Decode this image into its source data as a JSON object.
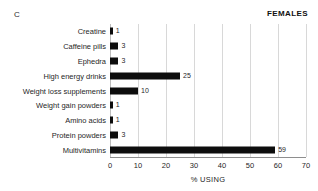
{
  "figure": {
    "panel_label": "C",
    "group_title": "FEMALES"
  },
  "chart_data": {
    "type": "bar",
    "orientation": "horizontal",
    "title": "FEMALES",
    "panel": "C",
    "xlabel": "% USING",
    "ylabel": "",
    "xlim": [
      0,
      70
    ],
    "xticks": [
      0,
      10,
      20,
      30,
      40,
      50,
      60,
      70
    ],
    "xtick_labels": [
      "0",
      "10",
      "20",
      "30",
      "40",
      "50",
      "60",
      "70"
    ],
    "grid": true,
    "grid_axis": "x",
    "legend": false,
    "bar_color": "#0d0d0d",
    "categories": [
      "Creatine",
      "Caffeine pills",
      "Ephedra",
      "High energy drinks",
      "Weight loss supplements",
      "Weight gain powders",
      "Amino acids",
      "Protein powders",
      "Multivitamins"
    ],
    "values": [
      1,
      3,
      3,
      25,
      10,
      1,
      1,
      3,
      59
    ],
    "value_labels": [
      "1",
      "3",
      "3",
      "25",
      "10",
      "1",
      "1",
      "3",
      "59"
    ]
  }
}
